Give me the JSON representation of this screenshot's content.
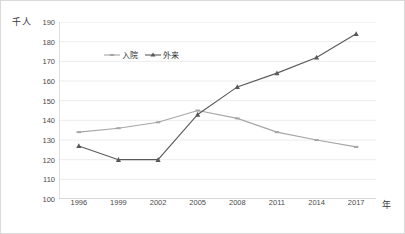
{
  "chart_data": {
    "type": "line",
    "title": "",
    "subtitle": "",
    "xlabel": "年",
    "ylabel": "千人",
    "categories": [
      "1996",
      "1999",
      "2002",
      "2005",
      "2008",
      "2011",
      "2014",
      "2017"
    ],
    "series": [
      {
        "name": "入院",
        "color": "#a6a6a6",
        "marker": "dash",
        "values": [
          134,
          136,
          139,
          145,
          141,
          134,
          130,
          126.5
        ]
      },
      {
        "name": "外来",
        "color": "#595959",
        "marker": "triangle",
        "values": [
          127,
          120,
          120,
          143,
          157,
          164,
          172,
          184
        ]
      }
    ],
    "ylim": [
      100,
      190
    ],
    "ytick_step": 10,
    "yticks": [
      "190",
      "180",
      "170",
      "160",
      "150",
      "140",
      "130",
      "120",
      "110",
      "100"
    ],
    "grid": true,
    "grid_color": "#ececec",
    "legend_position": "inside-top-left",
    "axis_color": "#bfbfbf",
    "border_color": "#d9d9d9"
  },
  "axes": {
    "y_unit_label": "千人",
    "x_unit_label": "年"
  }
}
